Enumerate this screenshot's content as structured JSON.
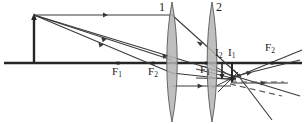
{
  "diagram": {
    "type": "optics-ray-diagram",
    "colors": {
      "axis": "#262626",
      "ray": "#3a3a3a",
      "lens_fill": "#b0b0b0",
      "lens_stroke": "#555555",
      "dashed_ray": "#555555",
      "label": "#1a1a1a",
      "background": "#ffffff"
    },
    "labels": {
      "lens1": "1",
      "lens2": "2",
      "focal_left_1": "F",
      "focal_left_1_sub": "1",
      "focal_left_2": "F",
      "focal_left_2_sub": "2",
      "focal_mid_1": "F",
      "focal_mid_1_sub": "1",
      "focal_right_2": "F",
      "focal_right_2_sub": "2",
      "image_2": "I",
      "image_2_sub": "2",
      "image_1": "I",
      "image_1_sub": "1"
    },
    "geometry": {
      "axis_y": 63,
      "axis_x_start": 4,
      "axis_x_end": 302,
      "object_x": 34,
      "object_top_y": 16,
      "lens1_x": 172,
      "lens2_x": 212,
      "focal_left_1_x": 118,
      "focal_left_2_x": 153,
      "focal_mid_1_x": 206,
      "focal_right_2_x": 272,
      "image_1_x": 232,
      "image_2_x": 222
    }
  }
}
